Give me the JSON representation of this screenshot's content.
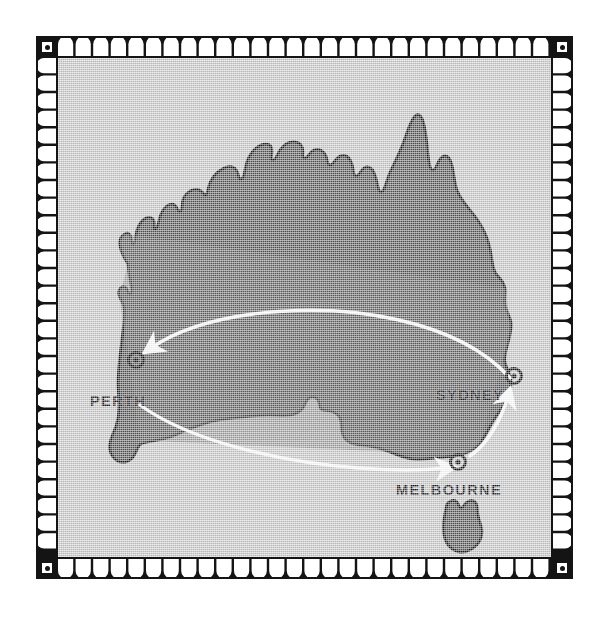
{
  "poster": {
    "subject": "Australia flight route map",
    "background_color": "#c9c9c9",
    "land_color": "#575757",
    "ink_color": "#141414",
    "route_color": "#ffffff"
  },
  "frame": {
    "style": "decorative-arch-border",
    "corner_marks": [
      "top-left",
      "top-right",
      "bottom-left",
      "bottom-right"
    ]
  },
  "map": {
    "landmasses": [
      {
        "name": "australia-mainland"
      },
      {
        "name": "tasmania"
      }
    ],
    "cities": [
      {
        "id": "perth",
        "label": "PERTH",
        "marker": "target-dot-icon"
      },
      {
        "id": "sydney",
        "label": "SYDNEY",
        "marker": "target-dot-icon"
      },
      {
        "id": "melbourne",
        "label": "MELBOURNE",
        "marker": "target-dot-icon"
      }
    ],
    "routes": [
      {
        "id": "sydney-to-perth",
        "from": "SYDNEY",
        "to": "PERTH",
        "style": "curved-arrow"
      },
      {
        "id": "perth-to-melbourne",
        "from": "PERTH",
        "to": "MELBOURNE",
        "style": "curved-arrow"
      },
      {
        "id": "melbourne-to-sydney",
        "from": "MELBOURNE",
        "to": "SYDNEY",
        "style": "curved-arrow"
      }
    ]
  }
}
